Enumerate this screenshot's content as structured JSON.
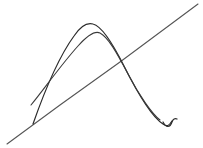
{
  "figure": {
    "title": "Hand-drawn sketch of a parabolic arc crossed by a straight line",
    "background_color": "#ffffff",
    "width": 203,
    "height": 148,
    "style": "pencil line drawing, no text labels, no axes ticks"
  },
  "palette": {
    "ink_dark": "#2b2b2b",
    "ink_mid": "#4a4a4a",
    "ink_light": "#6e6e6e",
    "paper": "#ffffff"
  },
  "strokes": [
    {
      "id": "secant-line",
      "name": "straight-diagonal-line",
      "description": "Long straight line running from lower-left to upper-right, crossing both arcs",
      "color": "#555555",
      "width": 1.1,
      "start": [
        7,
        144
      ],
      "end": [
        198,
        4
      ],
      "path": "M 7 144 L 60 105 L 120 62 L 198 4"
    },
    {
      "id": "outer-arc",
      "name": "outer-parabolic-arc",
      "description": "Upper/outer arc rising from lower-left, peaking near the top center, then descending steeply to a small hook at lower right",
      "color": "#2b2b2b",
      "width": 1.2,
      "start": [
        33,
        124
      ],
      "apex": [
        88,
        23
      ],
      "end": [
        172,
        124
      ],
      "path": "M 33 124 C 40 104 55 62 74 36 C 80 27 86 22 93 24 C 101 26 111 40 124 66 C 136 90 152 117 163 124 C 167 127 169 126 172 121"
    },
    {
      "id": "inner-arc",
      "name": "inner-parabolic-arc",
      "description": "Lower/inner arc nearly parallel to the outer arc, starting slightly higher on the left and merging with the outer arc on the right descent",
      "color": "#3a3a3a",
      "width": 1.1,
      "start": [
        31,
        105
      ],
      "apex": [
        92,
        31
      ],
      "end": [
        160,
        120
      ],
      "path": "M 31 105 C 42 92 60 66 78 46 C 86 37 94 30 100 33 C 108 37 117 53 128 74 C 139 95 152 114 160 120"
    },
    {
      "id": "end-hook",
      "name": "terminal-hook-tick",
      "description": "Small v-shaped hook at the bottom right end of the arcs",
      "color": "#2b2b2b",
      "width": 1.2,
      "path": "M 163 122 C 166 128 170 128 172 122 C 173 119 175 118 177 119"
    }
  ],
  "annotations": {
    "intersections": [
      {
        "name": "left-crossing",
        "point": [
          44,
          116
        ],
        "note": "straight line crosses the rising branch of the arcs"
      },
      {
        "name": "right-crossing",
        "point": [
          137,
          75
        ],
        "note": "straight line crosses the falling branch of the arcs"
      }
    ],
    "labels": []
  }
}
